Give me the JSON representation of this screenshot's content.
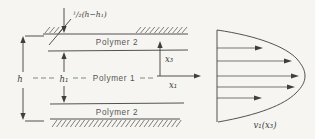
{
  "figure": {
    "labels": {
      "gap_dimension": "¹/₂(h−h₁)",
      "h": "h",
      "h1": "h₁",
      "x3": "x₃",
      "x1": "x₁",
      "polymer2_top": "Polymer 2",
      "polymer1": "Polymer 1",
      "polymer2_bottom": "Polymer 2",
      "velocity_profile": "v₁(x₃)"
    },
    "colors": {
      "paper": "#f6f5f1",
      "ink": "#3f3f3f",
      "text": "#4a4a4a"
    }
  }
}
